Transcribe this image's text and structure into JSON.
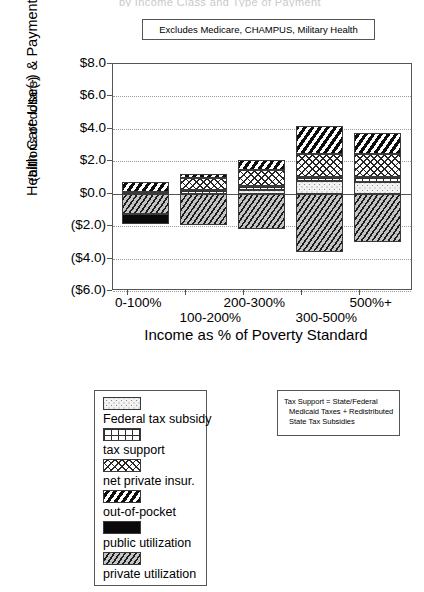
{
  "super_title": "by Income Class and Type of Payment",
  "excludes_note": "Excludes Medicare, CHAMPUS, Military Health",
  "axes": {
    "y_title_line1": "Health Care Use(-) & Payments(+)",
    "y_title_line2": "(billions of dollars)",
    "x_title": "Income as % of Poverty Standard",
    "y_ticks": [
      "$8.0",
      "$6.0",
      "$4.0",
      "$2.0",
      "$0.0",
      "($2.0)",
      "($4.0)",
      "($6.0)"
    ],
    "y_tick_values": [
      8.0,
      6.0,
      4.0,
      2.0,
      0.0,
      -2.0,
      -4.0,
      -6.0
    ]
  },
  "legend": {
    "items": [
      {
        "label": "Federal tax subsidy",
        "key": "federal_tax_subsidy",
        "pattern": "p-subsidy"
      },
      {
        "label": "tax support",
        "key": "tax_support",
        "pattern": "p-taxsupport"
      },
      {
        "label": "net private insur.",
        "key": "net_private_insurance",
        "pattern": "p-netins"
      },
      {
        "label": "out-of-pocket",
        "key": "out_of_pocket",
        "pattern": "p-oop"
      },
      {
        "label": "public utilization",
        "key": "public_utilization",
        "pattern": "p-public"
      },
      {
        "label": "private utilization",
        "key": "private_utilization",
        "pattern": "p-private"
      }
    ]
  },
  "note": {
    "line1": "Tax Support = State/Federal",
    "line2": "Medicaid Taxes + Redistributed",
    "line3": "State Tax Subsidies"
  },
  "chart_data": {
    "type": "bar",
    "subtype": "stacked-diverging",
    "title": "by Income Class and Type of Payment",
    "annotation": "Excludes Medicare, CHAMPUS, Military Health",
    "xlabel": "Income as % of Poverty Standard",
    "ylabel": "Health Care Use(-) & Payments(+) (billions of dollars)",
    "ylim": [
      -6.0,
      8.0
    ],
    "y_tick_step": 2.0,
    "grid": true,
    "legend_position": "below-left",
    "categories": [
      "0-100%",
      "100-200%",
      "200-300%",
      "300-500%",
      "500%+"
    ],
    "series": [
      {
        "name": "Federal tax subsidy",
        "sign": "positive",
        "values": [
          0.0,
          0.0,
          0.25,
          0.8,
          0.75
        ]
      },
      {
        "name": "tax support",
        "sign": "positive",
        "values": [
          0.1,
          0.25,
          0.2,
          0.25,
          0.3
        ]
      },
      {
        "name": "net private insur.",
        "sign": "positive",
        "values": [
          0.0,
          0.7,
          1.0,
          1.4,
          1.4
        ]
      },
      {
        "name": "out-of-pocket",
        "sign": "positive",
        "values": [
          0.6,
          0.25,
          0.65,
          1.7,
          1.3
        ]
      },
      {
        "name": "private utilization",
        "sign": "negative",
        "values": [
          -1.25,
          -1.9,
          -2.2,
          -3.6,
          -3.0
        ]
      },
      {
        "name": "public utilization",
        "sign": "negative",
        "values": [
          -0.6,
          0.0,
          0.0,
          0.0,
          0.0
        ]
      }
    ],
    "positive_totals": [
      0.7,
      1.2,
      2.1,
      4.15,
      3.75
    ],
    "negative_totals": [
      -1.85,
      -1.9,
      -2.2,
      -3.6,
      -3.0
    ]
  }
}
